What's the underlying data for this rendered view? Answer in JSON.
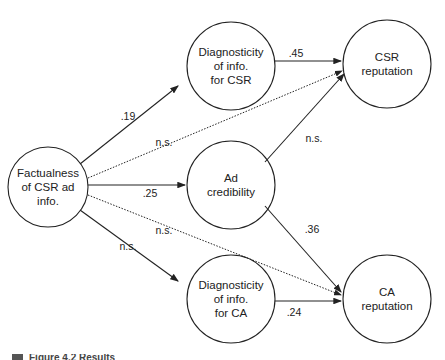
{
  "nodes": {
    "factualness": {
      "lines": [
        "Factualness",
        "of CSR ad",
        "info."
      ]
    },
    "diag_csr": {
      "lines": [
        "Diagnosticity",
        "of info.",
        "for CSR"
      ]
    },
    "ad_cred": {
      "lines": [
        "Ad",
        "credibility"
      ]
    },
    "diag_ca": {
      "lines": [
        "Diagnosticity",
        "of info.",
        "for CA"
      ]
    },
    "csr_rep": {
      "lines": [
        "CSR",
        "reputation"
      ]
    },
    "ca_rep": {
      "lines": [
        "CA",
        "reputation"
      ]
    }
  },
  "edges": {
    "fact_diagcsr": ".19",
    "fact_csrrep": "n.s.",
    "fact_adcred": ".25",
    "fact_carep": "n.s.",
    "fact_diagca": "n.s.",
    "diagcsr_csrrep": ".45",
    "adcred_csrrep": "n.s.",
    "adcred_carep": ".36",
    "diagca_carep": ".24"
  },
  "caption": {
    "text": "Figure 4.2 Results"
  }
}
